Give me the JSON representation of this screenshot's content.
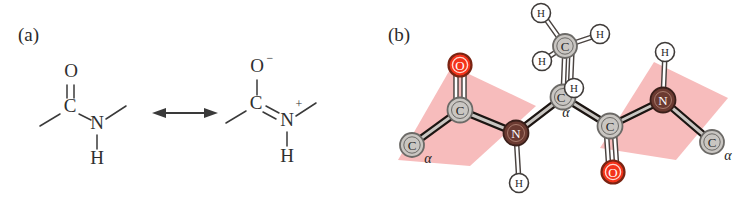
{
  "figure": {
    "panels": [
      {
        "id": "a",
        "label": "(a)",
        "caption_text": "(a)"
      },
      {
        "id": "b",
        "label": "(b)",
        "caption_text": "(b)"
      }
    ]
  },
  "panel_a": {
    "label": "(a)",
    "description": "peptide-bond resonance structures",
    "arrow": {
      "name": "resonance-arrow",
      "glyph": "double-headed"
    },
    "structure_left": {
      "name": "amide-neutral-form",
      "atoms": [
        {
          "id": "O",
          "symbol": "O",
          "charge": "",
          "x": 72,
          "y": 73
        },
        {
          "id": "C",
          "symbol": "C",
          "charge": "",
          "x": 70,
          "y": 108
        },
        {
          "id": "N",
          "symbol": "N",
          "charge": "",
          "x": 97,
          "y": 125
        },
        {
          "id": "H",
          "symbol": "H",
          "charge": "",
          "x": 97,
          "y": 160
        }
      ],
      "bonds": [
        {
          "from": "C",
          "to": "O",
          "order": 2
        },
        {
          "from": "C",
          "to": "N",
          "order": 1
        },
        {
          "from": "N",
          "to": "H",
          "order": 1
        },
        {
          "from": "C",
          "to": "methyl-left",
          "order": 1
        },
        {
          "from": "N",
          "to": "methyl-right",
          "order": 1
        }
      ]
    },
    "structure_right": {
      "name": "amide-charge-separated-form",
      "atoms": [
        {
          "id": "O",
          "symbol": "O",
          "charge": "−",
          "x": 258,
          "y": 68
        },
        {
          "id": "C",
          "symbol": "C",
          "charge": "",
          "x": 256,
          "y": 105
        },
        {
          "id": "N",
          "symbol": "N",
          "charge": "+",
          "x": 287,
          "y": 122
        },
        {
          "id": "H",
          "symbol": "H",
          "charge": "",
          "x": 287,
          "y": 158
        }
      ],
      "bonds": [
        {
          "from": "C",
          "to": "O",
          "order": 1
        },
        {
          "from": "C",
          "to": "N",
          "order": 2
        },
        {
          "from": "N",
          "to": "H",
          "order": 1
        },
        {
          "from": "C",
          "to": "methyl-left",
          "order": 1
        },
        {
          "from": "N",
          "to": "methyl-right",
          "order": 1
        }
      ]
    }
  },
  "panel_b": {
    "label": "(b)",
    "description": "ball-and-stick peptide backbone with two planar amide groups",
    "atom_labels": {
      "carbon": "C",
      "nitrogen": "N",
      "oxygen": "O",
      "hydrogen": "H",
      "alpha": "α"
    },
    "atoms": [
      {
        "name": "c-alpha-left",
        "element": "C",
        "label": "C",
        "sub": "α",
        "x": 412,
        "y": 145,
        "r": 12
      },
      {
        "name": "carbonyl-carbon-1",
        "element": "C",
        "label": "C",
        "sub": "",
        "x": 460,
        "y": 110,
        "r": 12.5
      },
      {
        "name": "carbonyl-oxygen-1",
        "element": "O",
        "label": "O",
        "sub": "",
        "x": 460,
        "y": 65,
        "r": 11.5
      },
      {
        "name": "amide-nitrogen-1",
        "element": "N",
        "label": "N",
        "sub": "",
        "x": 516,
        "y": 133,
        "r": 12.5
      },
      {
        "name": "amide-hydrogen-1",
        "element": "H",
        "label": "H",
        "sub": "",
        "x": 519,
        "y": 183,
        "r": 9.5
      },
      {
        "name": "c-alpha-center",
        "element": "C",
        "label": "C",
        "sub": "α",
        "x": 563,
        "y": 97,
        "r": 12.5
      },
      {
        "name": "c-alpha-hydrogen",
        "element": "H",
        "label": "H",
        "sub": "",
        "x": 570,
        "y": 88,
        "r": 9.5
      },
      {
        "name": "methyl-carbon",
        "element": "C",
        "label": "C",
        "sub": "",
        "x": 565,
        "y": 46,
        "r": 12
      },
      {
        "name": "methyl-hydrogen-1",
        "element": "H",
        "label": "H",
        "sub": "",
        "x": 541,
        "y": 13,
        "r": 9.5
      },
      {
        "name": "methyl-hydrogen-2",
        "element": "H",
        "label": "H",
        "sub": "",
        "x": 600,
        "y": 34,
        "r": 9.5
      },
      {
        "name": "methyl-hydrogen-3",
        "element": "H",
        "label": "H",
        "sub": "",
        "x": 542,
        "y": 61,
        "r": 9.5
      },
      {
        "name": "carbonyl-carbon-2",
        "element": "C",
        "label": "C",
        "sub": "",
        "x": 610,
        "y": 126,
        "r": 12.5
      },
      {
        "name": "carbonyl-oxygen-2",
        "element": "O",
        "label": "O",
        "sub": "",
        "x": 613,
        "y": 172,
        "r": 11.5
      },
      {
        "name": "amide-nitrogen-2",
        "element": "N",
        "label": "N",
        "sub": "",
        "x": 663,
        "y": 100,
        "r": 12.5
      },
      {
        "name": "amide-hydrogen-2",
        "element": "H",
        "label": "H",
        "sub": "",
        "x": 665,
        "y": 52,
        "r": 9.5
      },
      {
        "name": "c-alpha-right",
        "element": "C",
        "label": "C",
        "sub": "α",
        "x": 712,
        "y": 142,
        "r": 12
      }
    ],
    "planes": [
      {
        "name": "amide-plane-left",
        "points": "398,160 452,66 536,106 470,166"
      },
      {
        "name": "amide-plane-right",
        "points": "600,148 654,62 728,98 676,160"
      }
    ]
  },
  "colors": {
    "carbon": "#c9c6c2",
    "carbon_ring": "#6c6a67",
    "nitrogen": "#6b3a31",
    "nitrogen_ring": "#3a1f1a",
    "oxygen": "#f4331a",
    "oxygen_ring": "#7a2413",
    "hydrogen": "#ffffff",
    "hydrogen_ring": "#3f3b39",
    "plane_pink": "#f7bcbc",
    "bond_dark": "#1c1512",
    "line_dark": "#3a3a3a",
    "text_dark": "#2b2b2b",
    "background": "#ffffff"
  }
}
